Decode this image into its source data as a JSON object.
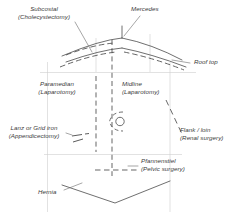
{
  "diagram": {
    "type": "anatomical-line-diagram",
    "stroke_color": "#4a4a4a",
    "faint_color": "#c9c9c9",
    "text_color": "#3a3a3a",
    "background": "#ffffff"
  },
  "labels": [
    {
      "id": "subcostal",
      "name": "Subcostal",
      "line1": "Subcostal",
      "line2": "(Cholecystectomy)",
      "x": 14,
      "y": 5,
      "align": "center",
      "incision_style": "dashed"
    },
    {
      "id": "mercedes",
      "name": "Mercedes",
      "line1": "Mercedes",
      "line2": "",
      "x": 131,
      "y": 5,
      "align": "left",
      "incision_style": "solid"
    },
    {
      "id": "rooftop",
      "name": "Roof top",
      "line1": "Roof top",
      "line2": "",
      "x": 192,
      "y": 58,
      "align": "left",
      "incision_style": "solid"
    },
    {
      "id": "paramedian",
      "name": "Paramedian",
      "line1": "Paramedian",
      "line2": "(Laparotomy)",
      "x": 47,
      "y": 80,
      "align": "center",
      "incision_style": "dashed"
    },
    {
      "id": "midline",
      "name": "Midline",
      "line1": "Midline",
      "line2": "(Laparotomy)",
      "x": 122,
      "y": 80,
      "align": "left",
      "incision_style": "dashed"
    },
    {
      "id": "lanz",
      "name": "Lanz or Grid iron",
      "line1": "Lanz or Grid iron",
      "line2": "(Appendicectomy)",
      "x": 8,
      "y": 124,
      "align": "left",
      "incision_style": "dashed"
    },
    {
      "id": "flank",
      "name": "Flank / loin",
      "line1": "Flank / loin",
      "line2": "(Renal surgery)",
      "x": 178,
      "y": 126,
      "align": "left",
      "incision_style": "dashed"
    },
    {
      "id": "pfannenstiel",
      "name": "Pfannenstiel",
      "line1": "Pfannenstiel",
      "line2": "(Pelvic surgery)",
      "x": 140,
      "y": 157,
      "align": "left",
      "incision_style": "dashed"
    },
    {
      "id": "hernia",
      "name": "Hernia",
      "line1": "Hernia",
      "line2": "",
      "x": 38,
      "y": 188,
      "align": "left",
      "incision_style": "solid"
    }
  ],
  "anatomy": {
    "umbilicus": "umbilicus-marker",
    "torso_left_edge": "torso-left-outline",
    "torso_right_edge": "torso-right-outline",
    "costal_margin": "costal-margin-outline",
    "inguinal_outline": "inguinal-groin-outline"
  }
}
